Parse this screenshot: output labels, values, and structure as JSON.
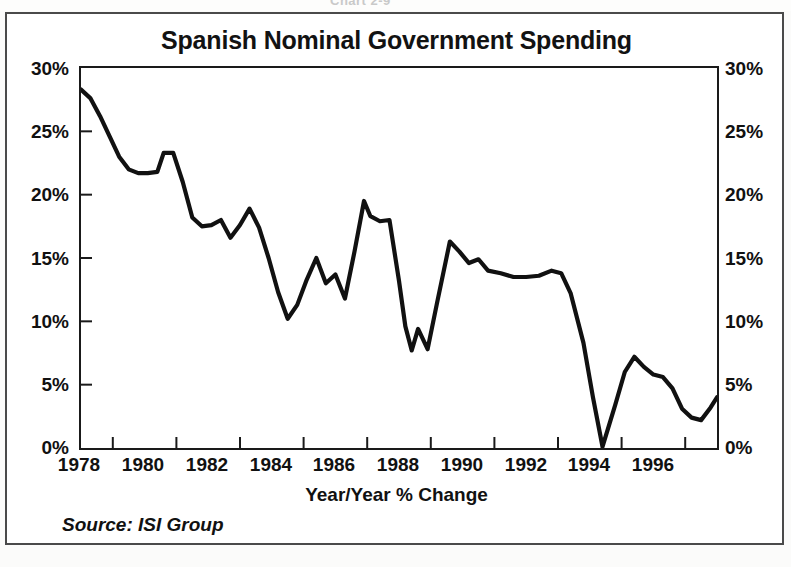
{
  "figure": {
    "title": "Spanish Nominal Government Spending",
    "x_axis_caption": "Year/Year % Change",
    "source_note": "Source: ISI Group",
    "top_cut_text": "Chart 2-9",
    "line_color": "#111111",
    "frame_color": "#1a1a1a",
    "background_color": "#ffffff"
  },
  "chart_data": {
    "type": "line",
    "title": "Spanish Nominal Government Spending",
    "xlabel": "Year/Year % Change",
    "ylabel": "",
    "xlim": [
      1978,
      1998
    ],
    "ylim": [
      0,
      30
    ],
    "grid": false,
    "legend": null,
    "y_tick_labels": [
      "30%",
      "25%",
      "20%",
      "15%",
      "10%",
      "5%",
      "0%"
    ],
    "y_tick_values": [
      30,
      25,
      20,
      15,
      10,
      5,
      0
    ],
    "y_axis_duplicated_right": true,
    "x_tick_labels": [
      "1978",
      "1980",
      "1982",
      "1984",
      "1986",
      "1988",
      "1990",
      "1992",
      "1994",
      "1996"
    ],
    "x_tick_values": [
      1978,
      1980,
      1982,
      1984,
      1986,
      1988,
      1990,
      1992,
      1994,
      1996
    ],
    "series": [
      {
        "name": "Spanish Nominal Government Spending",
        "unit": "percent",
        "x": [
          1978.0,
          1978.3,
          1978.6,
          1978.9,
          1979.2,
          1979.5,
          1979.8,
          1980.1,
          1980.4,
          1980.6,
          1980.9,
          1981.2,
          1981.5,
          1981.8,
          1982.1,
          1982.4,
          1982.7,
          1983.0,
          1983.3,
          1983.6,
          1983.9,
          1984.2,
          1984.5,
          1984.8,
          1985.1,
          1985.4,
          1985.7,
          1986.0,
          1986.3,
          1986.6,
          1986.9,
          1987.1,
          1987.4,
          1987.7,
          1988.0,
          1988.2,
          1988.4,
          1988.6,
          1988.9,
          1989.2,
          1989.6,
          1989.9,
          1990.2,
          1990.5,
          1990.8,
          1991.2,
          1991.6,
          1992.0,
          1992.4,
          1992.8,
          1993.1,
          1993.4,
          1993.8,
          1994.1,
          1994.4,
          1994.8,
          1995.1,
          1995.4,
          1995.7,
          1996.0,
          1996.3,
          1996.6,
          1996.9,
          1997.2,
          1997.5,
          1997.8,
          1998.0
        ],
        "y": [
          28.3,
          27.6,
          26.2,
          24.6,
          23.0,
          22.0,
          21.7,
          21.7,
          21.8,
          23.3,
          23.3,
          21.0,
          18.2,
          17.5,
          17.6,
          18.0,
          16.6,
          17.6,
          18.9,
          17.4,
          15.0,
          12.3,
          10.2,
          11.3,
          13.3,
          15.0,
          13.0,
          13.7,
          11.8,
          15.5,
          19.5,
          18.3,
          17.9,
          18.0,
          13.2,
          9.6,
          7.7,
          9.4,
          7.8,
          11.5,
          16.3,
          15.5,
          14.6,
          14.9,
          14.0,
          13.8,
          13.5,
          13.5,
          13.6,
          14.0,
          13.8,
          12.2,
          8.3,
          4.0,
          0.1,
          3.4,
          6.0,
          7.2,
          6.4,
          5.8,
          5.6,
          4.7,
          3.1,
          2.4,
          2.2,
          3.2,
          4.0
        ]
      }
    ],
    "annotations": [
      {
        "text": "Series peaks at 28.3% in 1978 and troughs at 0% in 1994"
      }
    ]
  }
}
